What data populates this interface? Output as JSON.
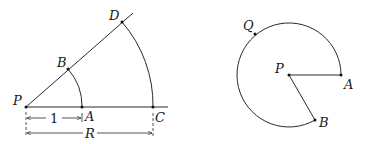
{
  "figure_left": {
    "description": "Two concentric arcs centered at P on rays P-C (horizontal) and P-D (inclined), unit radius arc A-B and radius R arc C-D",
    "points": {
      "P": {
        "label": "P",
        "x": 26,
        "y": 107
      },
      "A": {
        "label": "A",
        "x": 82,
        "y": 107
      },
      "B": {
        "label": "B",
        "x": 68,
        "y": 69
      },
      "C": {
        "label": "C",
        "x": 153,
        "y": 107
      },
      "D": {
        "label": "D",
        "x": 122,
        "y": 22
      }
    },
    "dimensions": {
      "unit": {
        "label": "1"
      },
      "radius": {
        "label": "R"
      }
    }
  },
  "figure_right": {
    "description": "Arc of circle centered at P from A counterclockwise through Q to B, with radii PA and PB",
    "points": {
      "P": {
        "label": "P",
        "x": 289,
        "y": 75
      },
      "A": {
        "label": "A",
        "x": 341,
        "y": 75
      },
      "B": {
        "label": "B",
        "x": 315,
        "y": 122
      },
      "Q": {
        "label": "Q",
        "x": 255,
        "y": 34
      }
    }
  }
}
